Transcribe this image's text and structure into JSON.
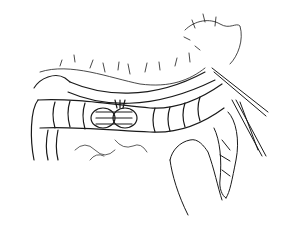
{
  "image": {
    "kind": "surgical line illustration",
    "subject": "transverse colon with end-to-end anastomosis, mesentery, retracted tissue, hand and instruments",
    "background_color": "#ffffff",
    "ink_color": "#1a1a1a"
  }
}
